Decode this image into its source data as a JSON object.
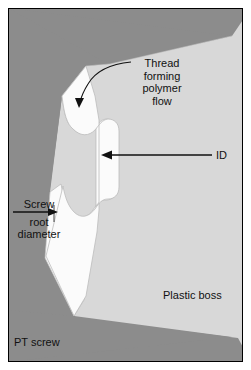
{
  "figure": {
    "width": 251,
    "height": 370,
    "background": "#ffffff",
    "border_color": "#000000"
  },
  "colors": {
    "screw_dark_gray": "#8c8c8c",
    "plastic_boss_light_gray": "#d8d8d8",
    "void_white": "#fbfbfb",
    "outline_gray": "#b0b0b0",
    "annotation_black": "#111111",
    "frame_white_margin": "#ffffff"
  },
  "regions": [
    {
      "name": "pt-screw",
      "label": "PT screw",
      "fill": "#8c8c8c",
      "description": "Dark gray screw body occupying the left side with two triangular thread flanks projecting to the right"
    },
    {
      "name": "plastic-boss",
      "label": "Plastic boss",
      "fill": "#d8d8d8",
      "description": "Light gray plastic boss material filling the right side and between thread flanks"
    },
    {
      "name": "polymer-flow-void",
      "label": "Thread forming polymer flow",
      "fill": "#fbfbfb",
      "description": "White hourglass-shaped cavity between the screw root and the formed thread"
    }
  ],
  "annotations": {
    "thread_flow": {
      "name": "thread-forming-polymer-flow",
      "lines": [
        "Thread",
        "forming",
        "polymer",
        "flow"
      ],
      "arrow": "curved-arrow-down-left",
      "arrow_target": "polymer flow region"
    },
    "inner_diameter": {
      "name": "inner-diameter",
      "label": "ID",
      "arrow": "horizontal-arrow-left",
      "arrow_target": "void inner diameter"
    },
    "screw_root_diameter": {
      "name": "screw-root-diameter",
      "lines": [
        "Screw",
        "root",
        "diameter"
      ],
      "dimension_line": "horizontal-arrow-right",
      "arrow_target": "screw root surface"
    },
    "plastic_boss": {
      "name": "plastic-boss-label",
      "label": "Plastic boss"
    },
    "pt_screw": {
      "name": "pt-screw-label",
      "label": "PT screw"
    }
  }
}
